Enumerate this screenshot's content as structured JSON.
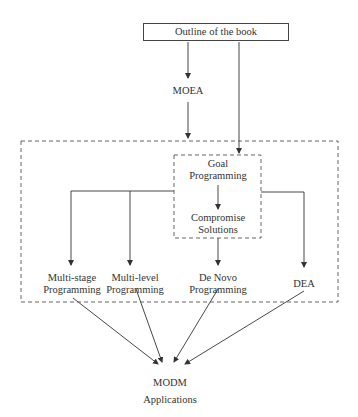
{
  "diagram": {
    "title_box": "Outline of the book",
    "nodes": {
      "moea": "MOEA",
      "goal_programming": [
        "Goal",
        "Programming"
      ],
      "compromise_solutions": [
        "Compromise",
        "Solutions"
      ],
      "multi_stage": [
        "Multi-stage",
        "Programming"
      ],
      "multi_level": [
        "Multi-level",
        "Programming"
      ],
      "de_novo": [
        "De Novo",
        "Programming"
      ],
      "dea": "DEA",
      "modm": [
        "MODM",
        "Applications"
      ]
    },
    "edges": [
      {
        "from": "Outline of the book",
        "to": "MOEA"
      },
      {
        "from": "MOEA",
        "to": "Outer group"
      },
      {
        "from": "Outline of the book",
        "to": "Goal Programming"
      },
      {
        "from": "Goal Programming",
        "to": "Compromise Solutions"
      },
      {
        "from": "Goal Programming",
        "to": "Multi-stage Programming"
      },
      {
        "from": "Goal Programming",
        "to": "Multi-level Programming"
      },
      {
        "from": "Compromise Solutions",
        "to": "De Novo Programming"
      },
      {
        "from": "Goal Programming",
        "to": "DEA"
      },
      {
        "from": "Multi-stage Programming",
        "to": "MODM Applications"
      },
      {
        "from": "Multi-level Programming",
        "to": "MODM Applications"
      },
      {
        "from": "De Novo Programming",
        "to": "MODM Applications"
      },
      {
        "from": "DEA",
        "to": "MODM Applications"
      }
    ],
    "colors": {
      "line": "#333333",
      "dashed_border": "#555555",
      "background": "#ffffff"
    }
  }
}
